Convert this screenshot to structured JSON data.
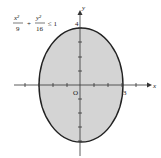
{
  "figure": {
    "inequality": {
      "term1_num": "x²",
      "term1_den": "9",
      "plus": "+",
      "term2_num": "y²",
      "term2_den": "16",
      "rel": "≤ 1"
    },
    "axes": {
      "x_label": "x",
      "y_label": "y",
      "origin_label": "O",
      "x_intercept_label": "3",
      "y_intercept_label": "4"
    },
    "colors": {
      "fill": "#d4d4d4",
      "stroke": "#222222",
      "axis": "#333333"
    }
  }
}
